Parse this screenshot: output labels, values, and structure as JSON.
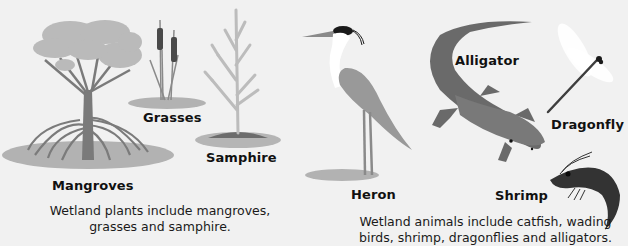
{
  "plants": {
    "labels": {
      "mangroves": "Mangroves",
      "grasses": "Grasses",
      "samphire": "Samphire"
    },
    "caption_line1": "Wetland plants include mangroves,",
    "caption_line2": "grasses and samphire."
  },
  "animals": {
    "labels": {
      "heron": "Heron",
      "alligator": "Alligator",
      "dragonfly": "Dragonfly",
      "shrimp": "Shrimp"
    },
    "caption_line1": "Wetland animals include catfish, wading",
    "caption_line2": "birds, shrimp, dragonflies and alligators."
  },
  "colors": {
    "background": "#f1f1f1",
    "ground": "#b4b4b4",
    "foliage": "#b9b9b9",
    "trunk": "#7a7a7a",
    "dark": "#3a3a3a"
  }
}
